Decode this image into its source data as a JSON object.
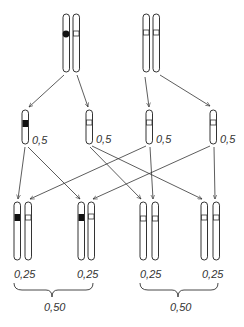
{
  "diagram": {
    "type": "genetic-cross",
    "parents": [
      {
        "id": "parent-1",
        "chromosomes": [
          {
            "marker": "black-dot"
          },
          {
            "marker": "open-band"
          }
        ]
      },
      {
        "id": "parent-2",
        "chromosomes": [
          {
            "marker": "open-band"
          },
          {
            "marker": "open-band"
          }
        ]
      }
    ],
    "gametes": [
      {
        "id": "gamete-1",
        "marker": "black-band",
        "freq_label": "0,5"
      },
      {
        "id": "gamete-2",
        "marker": "open-band",
        "freq_label": "0,5"
      },
      {
        "id": "gamete-3",
        "marker": "open-band",
        "freq_label": "0,5"
      },
      {
        "id": "gamete-4",
        "marker": "open-band",
        "freq_label": "0,5"
      }
    ],
    "offspring": [
      {
        "id": "offspring-1",
        "markers": [
          "black-band",
          "open-band"
        ],
        "freq_label": "0,25"
      },
      {
        "id": "offspring-2",
        "markers": [
          "black-band",
          "open-band"
        ],
        "freq_label": "0,25"
      },
      {
        "id": "offspring-3",
        "markers": [
          "open-band",
          "open-band"
        ],
        "freq_label": "0,25"
      },
      {
        "id": "offspring-4",
        "markers": [
          "open-band",
          "open-band"
        ],
        "freq_label": "0,25"
      }
    ],
    "groups": [
      {
        "id": "group-left",
        "members": [
          "offspring-1",
          "offspring-2"
        ],
        "sum_label": "0,50"
      },
      {
        "id": "group-right",
        "members": [
          "offspring-3",
          "offspring-4"
        ],
        "sum_label": "0,50"
      }
    ],
    "colors": {
      "line": "#333333",
      "fill_dark": "#111111",
      "background": "#ffffff"
    }
  }
}
